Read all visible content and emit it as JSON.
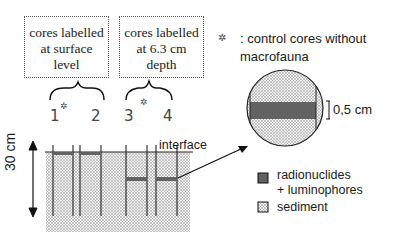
{
  "boxes": [
    {
      "line1": "cores labelled",
      "line2": "at surface",
      "line3": "level"
    },
    {
      "line1": "cores labelled",
      "line2": "at 6.3 cm",
      "line3": "depth"
    }
  ],
  "cores": [
    {
      "label": "1",
      "control": true
    },
    {
      "label": "2",
      "control": false
    },
    {
      "label": "3",
      "control": true
    },
    {
      "label": "4",
      "control": false
    }
  ],
  "legend": {
    "control_symbol": "✲",
    "control_text_1": ": control cores without",
    "control_text_2": "macrofauna",
    "radionuclides_1": "radionuclides",
    "radionuclides_2": "+ luminophores",
    "sediment": "sediment"
  },
  "labels": {
    "interface": "interface",
    "depth": "30 cm",
    "scale": "0,5 cm"
  },
  "colors": {
    "sediment": "#d8d8d8",
    "tracer": "#666666",
    "line": "#222222"
  }
}
